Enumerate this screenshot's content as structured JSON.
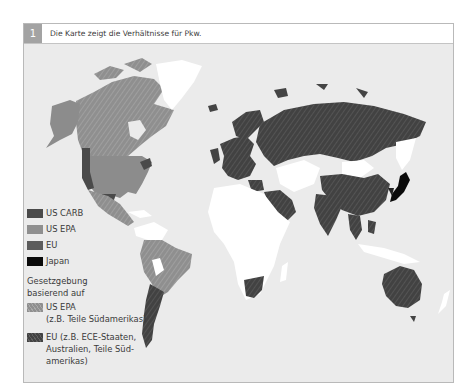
{
  "figure": {
    "number": "1",
    "caption": "Die Karte zeigt die Verhältnisse für Pkw."
  },
  "colors": {
    "background": "#ebebeb",
    "us_carb": "#4a4a4a",
    "us_epa": "#8c8c8c",
    "eu": "#5a5a5a",
    "japan": "#0a0a0a",
    "neutral_land": "#ffffff",
    "hatched_us_epa": "#909090",
    "hatched_eu": "#444444"
  },
  "legend": {
    "items": [
      {
        "label": "US CARB",
        "color": "#4a4a4a"
      },
      {
        "label": "US EPA",
        "color": "#8f8f8f"
      },
      {
        "label": "EU",
        "color": "#5c5c5c"
      },
      {
        "label": "Japan",
        "color": "#0a0a0a"
      }
    ],
    "heading_line1": "Gesetzgebung",
    "heading_line2": "basierend auf",
    "based_on": [
      {
        "label": "US EPA",
        "note": "(z.B. Teile Südamerikas)"
      },
      {
        "label": "EU (z.B. ECE-Staaten,",
        "line2": "Australien, Teile Süd-",
        "line3": "amerikas)"
      }
    ]
  }
}
